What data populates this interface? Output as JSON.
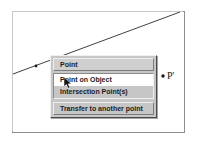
{
  "canvas": {
    "name": "geometry-drawing-area",
    "background_color": "#ffffff",
    "border_color": "#8e8e8e"
  },
  "geometry": {
    "line": {
      "name": "construction-line",
      "x1": 13,
      "y1": 74,
      "x2": 180,
      "y2": 12,
      "color": "#2b2b2b"
    },
    "points": [
      {
        "name": "point-on-line",
        "label": "",
        "x": 36,
        "y": 66,
        "color": "#1a1a1a"
      },
      {
        "name": "point-p-prime",
        "label": "P'",
        "x": 163,
        "y": 76,
        "color": "#1a1a1a"
      }
    ]
  },
  "labels": {
    "p_prime": "P'"
  },
  "context_menu": {
    "name": "point-context-menu",
    "title": "Point",
    "items": [
      {
        "label": "Point on Object",
        "state": "hovered"
      },
      {
        "label": "Intersection Point(s)",
        "state": "normal"
      }
    ],
    "footer_item": {
      "label": "Transfer to another point",
      "state": "normal"
    },
    "colors": {
      "face": "#c6c6c6",
      "highlight": "#ffffff",
      "shadow": "#4b4b4b",
      "text": "#1c1c1c"
    }
  },
  "cursor": {
    "name": "mouse-pointer",
    "x": 64,
    "y": 77
  }
}
